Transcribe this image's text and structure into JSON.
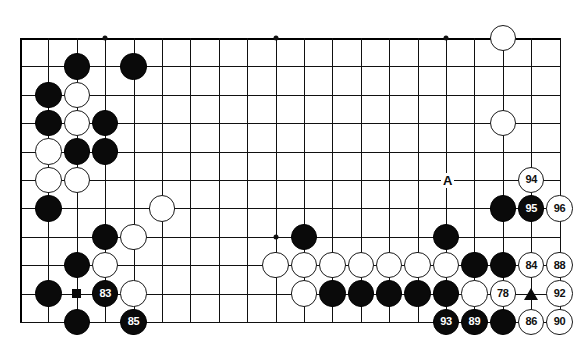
{
  "diagram": {
    "type": "go-board-diagram",
    "board": {
      "cols": 20,
      "rows": 11,
      "origin_x": 20,
      "origin_y": 38,
      "spacing": 28.4,
      "stone_radius": 13.2,
      "line_color": "#111111",
      "background": "#ffffff",
      "star_points": [
        {
          "col": 3,
          "row": 0
        },
        {
          "col": 9,
          "row": 0
        },
        {
          "col": 15,
          "row": 0
        },
        {
          "col": 3,
          "row": 7
        },
        {
          "col": 9,
          "row": 7
        },
        {
          "col": 15,
          "row": 7
        }
      ]
    },
    "stones": [
      {
        "col": 17,
        "row": 0,
        "color": "white",
        "label": ""
      },
      {
        "col": 2,
        "row": 1,
        "color": "black",
        "label": ""
      },
      {
        "col": 4,
        "row": 1,
        "color": "black",
        "label": ""
      },
      {
        "col": 1,
        "row": 2,
        "color": "black",
        "label": ""
      },
      {
        "col": 2,
        "row": 2,
        "color": "white",
        "label": ""
      },
      {
        "col": 1,
        "row": 3,
        "color": "black",
        "label": ""
      },
      {
        "col": 2,
        "row": 3,
        "color": "white",
        "label": ""
      },
      {
        "col": 3,
        "row": 3,
        "color": "black",
        "label": ""
      },
      {
        "col": 17,
        "row": 3,
        "color": "white",
        "label": ""
      },
      {
        "col": 1,
        "row": 4,
        "color": "white",
        "label": ""
      },
      {
        "col": 2,
        "row": 4,
        "color": "black",
        "label": ""
      },
      {
        "col": 3,
        "row": 4,
        "color": "black",
        "label": ""
      },
      {
        "col": 18,
        "row": 5,
        "color": "white",
        "label": "94"
      },
      {
        "col": 1,
        "row": 5,
        "color": "white",
        "label": ""
      },
      {
        "col": 2,
        "row": 5,
        "color": "white",
        "label": ""
      },
      {
        "col": 1,
        "row": 6,
        "color": "black",
        "label": ""
      },
      {
        "col": 5,
        "row": 6,
        "color": "white",
        "label": ""
      },
      {
        "col": 17,
        "row": 6,
        "color": "black",
        "label": ""
      },
      {
        "col": 18,
        "row": 6,
        "color": "black",
        "label": "95"
      },
      {
        "col": 19,
        "row": 6,
        "color": "white",
        "label": "96"
      },
      {
        "col": 10,
        "row": 7,
        "color": "black",
        "label": ""
      },
      {
        "col": 15,
        "row": 7,
        "color": "black",
        "label": ""
      },
      {
        "col": 3,
        "row": 7,
        "color": "black",
        "label": ""
      },
      {
        "col": 4,
        "row": 7,
        "color": "white",
        "label": ""
      },
      {
        "col": 2,
        "row": 8,
        "color": "black",
        "label": ""
      },
      {
        "col": 3,
        "row": 8,
        "color": "white",
        "label": ""
      },
      {
        "col": 9,
        "row": 8,
        "color": "white",
        "label": ""
      },
      {
        "col": 10,
        "row": 8,
        "color": "white",
        "label": ""
      },
      {
        "col": 11,
        "row": 8,
        "color": "white",
        "label": ""
      },
      {
        "col": 12,
        "row": 8,
        "color": "white",
        "label": ""
      },
      {
        "col": 13,
        "row": 8,
        "color": "white",
        "label": ""
      },
      {
        "col": 14,
        "row": 8,
        "color": "white",
        "label": ""
      },
      {
        "col": 15,
        "row": 8,
        "color": "white",
        "label": ""
      },
      {
        "col": 16,
        "row": 8,
        "color": "black",
        "label": ""
      },
      {
        "col": 17,
        "row": 8,
        "color": "black",
        "label": ""
      },
      {
        "col": 18,
        "row": 8,
        "color": "white",
        "label": "84"
      },
      {
        "col": 19,
        "row": 8,
        "color": "white",
        "label": "88"
      },
      {
        "col": 1,
        "row": 9,
        "color": "black",
        "label": ""
      },
      {
        "col": 3,
        "row": 9,
        "color": "black",
        "label": "83"
      },
      {
        "col": 4,
        "row": 9,
        "color": "white",
        "label": ""
      },
      {
        "col": 10,
        "row": 9,
        "color": "white",
        "label": ""
      },
      {
        "col": 11,
        "row": 9,
        "color": "black",
        "label": ""
      },
      {
        "col": 12,
        "row": 9,
        "color": "black",
        "label": ""
      },
      {
        "col": 13,
        "row": 9,
        "color": "black",
        "label": ""
      },
      {
        "col": 14,
        "row": 9,
        "color": "black",
        "label": ""
      },
      {
        "col": 15,
        "row": 9,
        "color": "black",
        "label": ""
      },
      {
        "col": 16,
        "row": 9,
        "color": "white",
        "label": ""
      },
      {
        "col": 17,
        "row": 9,
        "color": "white",
        "label": "78"
      },
      {
        "col": 19,
        "row": 9,
        "color": "white",
        "label": "92"
      },
      {
        "col": 2,
        "row": 10,
        "color": "black",
        "label": ""
      },
      {
        "col": 4,
        "row": 10,
        "color": "black",
        "label": "85"
      },
      {
        "col": 15,
        "row": 10,
        "color": "black",
        "label": "93"
      },
      {
        "col": 16,
        "row": 10,
        "color": "black",
        "label": "89"
      },
      {
        "col": 17,
        "row": 10,
        "color": "black",
        "label": ""
      },
      {
        "col": 18,
        "row": 10,
        "color": "white",
        "label": "86"
      },
      {
        "col": 19,
        "row": 10,
        "color": "white",
        "label": "90"
      }
    ],
    "markers": [
      {
        "kind": "square",
        "col": 2,
        "row": 9,
        "color": "#0a0a0a"
      },
      {
        "kind": "triangle",
        "col": 18,
        "row": 9,
        "color": "#0a0a0a"
      },
      {
        "kind": "letter",
        "col": 15,
        "row": 5,
        "text": "A",
        "color": "#0a0a0a"
      }
    ],
    "move_numbers": [
      "78",
      "83",
      "84",
      "85",
      "86",
      "88",
      "89",
      "90",
      "92",
      "93",
      "94",
      "95",
      "96"
    ],
    "letters": [
      "A"
    ]
  }
}
